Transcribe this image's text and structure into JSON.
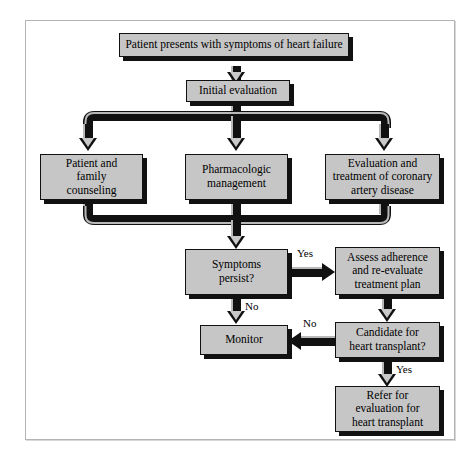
{
  "diagram": {
    "title_visible": false,
    "frame": {
      "border_color": "#b4b4b4"
    },
    "style": {
      "node_fill": "#c6c6c6",
      "node_border": "#111111",
      "shadow_color": "#111111",
      "connector_dark": "#111111",
      "connector_light": "#b9b9b9",
      "background": "#ffffff"
    },
    "nodes": [
      {
        "id": "start",
        "label": "Patient presents with symptoms of heart failure",
        "lines": [
          "Patient presents with symptoms of heart failure"
        ]
      },
      {
        "id": "initial",
        "label": "Initial evaluation",
        "lines": [
          "Initial evaluation"
        ]
      },
      {
        "id": "counseling",
        "label": "Patient and family counseling",
        "lines": [
          "Patient and",
          "family",
          "counseling"
        ]
      },
      {
        "id": "pharm",
        "label": "Pharmacologic management",
        "lines": [
          "Pharmacologic",
          "management"
        ]
      },
      {
        "id": "cad",
        "label": "Evaluation and treatment of coronary artery disease",
        "lines": [
          "Evaluation and",
          "treatment of coronary",
          "artery disease"
        ]
      },
      {
        "id": "persist",
        "label": "Symptoms persist?",
        "lines": [
          "Symptoms",
          "persist?"
        ]
      },
      {
        "id": "assess",
        "label": "Assess adherence and re-evaluate treatment plan",
        "lines": [
          "Assess adherence",
          "and re-evaluate",
          "treatment plan"
        ]
      },
      {
        "id": "monitor",
        "label": "Monitor",
        "lines": [
          "Monitor"
        ]
      },
      {
        "id": "candidate",
        "label": "Candidate for heart transplant?",
        "lines": [
          "Candidate for",
          "heart transplant?"
        ]
      },
      {
        "id": "refer",
        "label": "Refer for evaluation for heart transplant",
        "lines": [
          "Refer for",
          "evaluation for",
          "heart transplant"
        ]
      }
    ],
    "branch_labels": {
      "persist_yes": "Yes",
      "persist_no": "No",
      "candidate_no": "No",
      "candidate_yes": "Yes"
    },
    "edges": [
      {
        "from": "start",
        "to": "initial",
        "label": ""
      },
      {
        "from": "initial",
        "to": "counseling",
        "label": ""
      },
      {
        "from": "initial",
        "to": "pharm",
        "label": ""
      },
      {
        "from": "initial",
        "to": "cad",
        "label": ""
      },
      {
        "from": "counseling",
        "to": "persist",
        "label": ""
      },
      {
        "from": "pharm",
        "to": "persist",
        "label": ""
      },
      {
        "from": "cad",
        "to": "persist",
        "label": ""
      },
      {
        "from": "persist",
        "to": "assess",
        "label": "Yes"
      },
      {
        "from": "persist",
        "to": "monitor",
        "label": "No"
      },
      {
        "from": "assess",
        "to": "candidate",
        "label": ""
      },
      {
        "from": "candidate",
        "to": "monitor",
        "label": "No"
      },
      {
        "from": "candidate",
        "to": "refer",
        "label": "Yes"
      }
    ]
  }
}
